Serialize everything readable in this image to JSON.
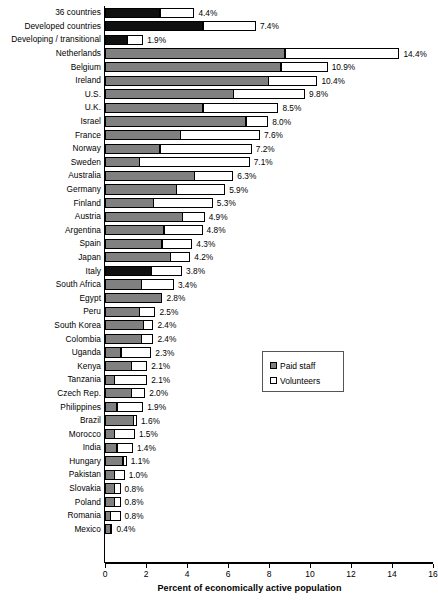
{
  "chart_data": {
    "type": "bar",
    "orientation": "horizontal",
    "stacked": true,
    "title": "",
    "xlabel": "Percent of economically active population",
    "ylabel": "",
    "xlim": [
      0,
      16
    ],
    "xticks": [
      0,
      2,
      4,
      6,
      8,
      10,
      12,
      14,
      16
    ],
    "grid": false,
    "legend_position": "middle-right",
    "colors": {
      "paid_staff": "#808080",
      "volunteers": "#ffffff",
      "highlight": "#101010",
      "outline": "#000000"
    },
    "series": [
      {
        "name": "Paid staff",
        "key": "paid"
      },
      {
        "name": "Volunteers",
        "key": "volunteers"
      }
    ],
    "categories": [
      "36 countries",
      "Developed countries",
      "Developing / transitional",
      "Netherlands",
      "Belgium",
      "Ireland",
      "U.S.",
      "U.K.",
      "Israel",
      "France",
      "Norway",
      "Sweden",
      "Australia",
      "Germany",
      "Finland",
      "Austria",
      "Argentina",
      "Spain",
      "Japan",
      "Italy",
      "South Africa",
      "Egypt",
      "Peru",
      "South Korea",
      "Colombia",
      "Uganda",
      "Kenya",
      "Tanzania",
      "Czech Rep.",
      "Philippines",
      "Brazil",
      "Morocco",
      "India",
      "Hungary",
      "Pakistan",
      "Slovakia",
      "Poland",
      "Romania",
      "Mexico"
    ],
    "rows": [
      {
        "label": "36 countries",
        "paid": 2.7,
        "volunteers": 1.7,
        "total": 4.4,
        "value_label": "4.4%",
        "highlight": true
      },
      {
        "label": "Developed countries",
        "paid": 4.8,
        "volunteers": 2.6,
        "total": 7.4,
        "value_label": "7.4%",
        "highlight": true
      },
      {
        "label": "Developing / transitional",
        "paid": 1.1,
        "volunteers": 0.8,
        "total": 1.9,
        "value_label": "1.9%",
        "highlight": true
      },
      {
        "label": "Netherlands",
        "paid": 8.8,
        "volunteers": 5.6,
        "total": 14.4,
        "value_label": "14.4%",
        "highlight": false
      },
      {
        "label": "Belgium",
        "paid": 8.6,
        "volunteers": 2.3,
        "total": 10.9,
        "value_label": "10.9%",
        "highlight": false
      },
      {
        "label": "Ireland",
        "paid": 8.0,
        "volunteers": 2.4,
        "total": 10.4,
        "value_label": "10.4%",
        "highlight": false
      },
      {
        "label": "U.S.",
        "paid": 6.3,
        "volunteers": 3.5,
        "total": 9.8,
        "value_label": "9.8%",
        "highlight": false
      },
      {
        "label": "U.K.",
        "paid": 4.8,
        "volunteers": 3.7,
        "total": 8.5,
        "value_label": "8.5%",
        "highlight": false
      },
      {
        "label": "Israel",
        "paid": 6.9,
        "volunteers": 1.1,
        "total": 8.0,
        "value_label": "8.0%",
        "highlight": false
      },
      {
        "label": "France",
        "paid": 3.7,
        "volunteers": 3.9,
        "total": 7.6,
        "value_label": "7.6%",
        "highlight": false
      },
      {
        "label": "Norway",
        "paid": 2.7,
        "volunteers": 4.5,
        "total": 7.2,
        "value_label": "7.2%",
        "highlight": false
      },
      {
        "label": "Sweden",
        "paid": 1.7,
        "volunteers": 5.4,
        "total": 7.1,
        "value_label": "7.1%",
        "highlight": false
      },
      {
        "label": "Australia",
        "paid": 4.4,
        "volunteers": 1.9,
        "total": 6.3,
        "value_label": "6.3%",
        "highlight": false
      },
      {
        "label": "Germany",
        "paid": 3.5,
        "volunteers": 2.4,
        "total": 5.9,
        "value_label": "5.9%",
        "highlight": false
      },
      {
        "label": "Finland",
        "paid": 2.4,
        "volunteers": 2.9,
        "total": 5.3,
        "value_label": "5.3%",
        "highlight": false
      },
      {
        "label": "Austria",
        "paid": 3.8,
        "volunteers": 1.1,
        "total": 4.9,
        "value_label": "4.9%",
        "highlight": false
      },
      {
        "label": "Argentina",
        "paid": 2.9,
        "volunteers": 1.9,
        "total": 4.8,
        "value_label": "4.8%",
        "highlight": false
      },
      {
        "label": "Spain",
        "paid": 2.8,
        "volunteers": 1.5,
        "total": 4.3,
        "value_label": "4.3%",
        "highlight": false
      },
      {
        "label": "Japan",
        "paid": 3.2,
        "volunteers": 1.0,
        "total": 4.2,
        "value_label": "4.2%",
        "highlight": false
      },
      {
        "label": "Italy",
        "paid": 2.3,
        "volunteers": 1.5,
        "total": 3.8,
        "value_label": "3.8%",
        "highlight": true
      },
      {
        "label": "South Africa",
        "paid": 1.8,
        "volunteers": 1.6,
        "total": 3.4,
        "value_label": "3.4%",
        "highlight": false
      },
      {
        "label": "Egypt",
        "paid": 2.8,
        "volunteers": 0.0,
        "total": 2.8,
        "value_label": "2.8%",
        "highlight": false
      },
      {
        "label": "Peru",
        "paid": 1.7,
        "volunteers": 0.8,
        "total": 2.5,
        "value_label": "2.5%",
        "highlight": false
      },
      {
        "label": "South Korea",
        "paid": 1.9,
        "volunteers": 0.5,
        "total": 2.4,
        "value_label": "2.4%",
        "highlight": false
      },
      {
        "label": "Colombia",
        "paid": 1.8,
        "volunteers": 0.6,
        "total": 2.4,
        "value_label": "2.4%",
        "highlight": false
      },
      {
        "label": "Uganda",
        "paid": 0.8,
        "volunteers": 1.5,
        "total": 2.3,
        "value_label": "2.3%",
        "highlight": false
      },
      {
        "label": "Kenya",
        "paid": 1.3,
        "volunteers": 0.8,
        "total": 2.1,
        "value_label": "2.1%",
        "highlight": false
      },
      {
        "label": "Tanzania",
        "paid": 0.5,
        "volunteers": 1.6,
        "total": 2.1,
        "value_label": "2.1%",
        "highlight": false
      },
      {
        "label": "Czech Rep.",
        "paid": 1.3,
        "volunteers": 0.7,
        "total": 2.0,
        "value_label": "2.0%",
        "highlight": false
      },
      {
        "label": "Philippines",
        "paid": 0.6,
        "volunteers": 1.3,
        "total": 1.9,
        "value_label": "1.9%",
        "highlight": false
      },
      {
        "label": "Brazil",
        "paid": 1.4,
        "volunteers": 0.2,
        "total": 1.6,
        "value_label": "1.6%",
        "highlight": false
      },
      {
        "label": "Morocco",
        "paid": 0.5,
        "volunteers": 1.0,
        "total": 1.5,
        "value_label": "1.5%",
        "highlight": false
      },
      {
        "label": "India",
        "paid": 0.6,
        "volunteers": 0.8,
        "total": 1.4,
        "value_label": "1.4%",
        "highlight": false
      },
      {
        "label": "Hungary",
        "paid": 0.9,
        "volunteers": 0.2,
        "total": 1.1,
        "value_label": "1.1%",
        "highlight": false
      },
      {
        "label": "Pakistan",
        "paid": 0.5,
        "volunteers": 0.5,
        "total": 1.0,
        "value_label": "1.0%",
        "highlight": false
      },
      {
        "label": "Slovakia",
        "paid": 0.5,
        "volunteers": 0.3,
        "total": 0.8,
        "value_label": "0.8%",
        "highlight": false
      },
      {
        "label": "Poland",
        "paid": 0.5,
        "volunteers": 0.3,
        "total": 0.8,
        "value_label": "0.8%",
        "highlight": false
      },
      {
        "label": "Romania",
        "paid": 0.3,
        "volunteers": 0.5,
        "total": 0.8,
        "value_label": "0.8%",
        "highlight": false
      },
      {
        "label": "Mexico",
        "paid": 0.3,
        "volunteers": 0.1,
        "total": 0.4,
        "value_label": "0.4%",
        "highlight": false
      }
    ]
  },
  "legend": {
    "items": [
      {
        "label": "Paid staff",
        "swatch": "paid"
      },
      {
        "label": "Volunteers",
        "swatch": "vol"
      }
    ]
  },
  "axis": {
    "title": "Percent of economically active population",
    "tick_labels": [
      "0",
      "2",
      "4",
      "6",
      "8",
      "10",
      "12",
      "14",
      "16"
    ]
  }
}
